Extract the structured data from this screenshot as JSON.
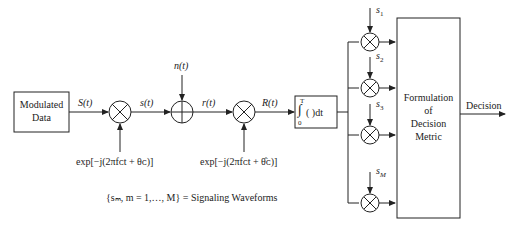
{
  "diagram": {
    "blocks": {
      "source": {
        "line1": "Modulated",
        "line2": "Data"
      },
      "integrator": {
        "upper": "T",
        "lower": "0",
        "body": "(   )dt"
      },
      "metric": {
        "line1": "Formulation",
        "line2": "of",
        "line3": "Decision",
        "line4": "Metric"
      }
    },
    "signals": {
      "S": "S(t)",
      "s": "s(t)",
      "n": "n(t)",
      "r": "r(t)",
      "R": "R(t)",
      "output": "Decision"
    },
    "oscillators": {
      "tx": "exp[−j(2πfᴄt + θᴄ)]",
      "rx": "exp[−j(2πfᴄt + θ̂ᴄ)]"
    },
    "references": [
      "s₁",
      "s₂",
      "s₃",
      "sₘ"
    ],
    "reference_labels": {
      "s1": "s",
      "s1_sub": "1",
      "s2": "s",
      "s2_sub": "2",
      "s3": "s",
      "s3_sub": "3",
      "sM": "s",
      "sM_sub": "M"
    },
    "legend": "{sₘ, m = 1,…, M} = Signaling Waveforms"
  }
}
